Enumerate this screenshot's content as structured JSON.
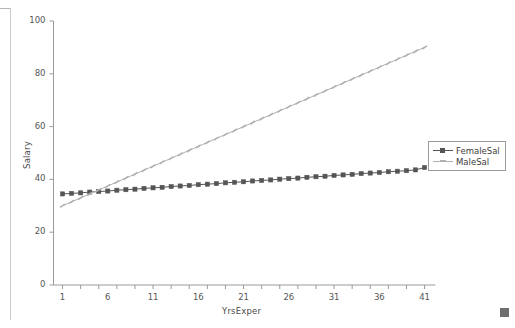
{
  "window": {
    "resize_handle": "resize-grip"
  },
  "chart_data": {
    "type": "line",
    "title": "",
    "xlabel": "YrsExper",
    "ylabel": "Salary",
    "xlim": [
      0,
      42
    ],
    "ylim": [
      0,
      100
    ],
    "xticks": [
      1,
      6,
      11,
      16,
      21,
      26,
      31,
      36,
      41
    ],
    "xtick_labels": [
      "1",
      "6",
      "11",
      "16",
      "21",
      "26",
      "31",
      "36",
      "41"
    ],
    "yticks": [
      0,
      20,
      40,
      60,
      80,
      100
    ],
    "ytick_labels": [
      "0",
      "20",
      "40",
      "60",
      "80",
      "100"
    ],
    "grid": false,
    "legend_position": "right",
    "x": [
      1,
      2,
      3,
      4,
      5,
      6,
      7,
      8,
      9,
      10,
      11,
      12,
      13,
      14,
      15,
      16,
      17,
      18,
      19,
      20,
      21,
      22,
      23,
      24,
      25,
      26,
      27,
      28,
      29,
      30,
      31,
      32,
      33,
      34,
      35,
      36,
      37,
      38,
      39,
      40,
      41
    ],
    "series": [
      {
        "name": "FemaleSal",
        "color": "#555555",
        "marker": "square",
        "values": [
          34.5,
          34.7,
          34.9,
          35.2,
          35.4,
          35.6,
          35.9,
          36.1,
          36.3,
          36.6,
          36.8,
          37.0,
          37.3,
          37.5,
          37.7,
          38.0,
          38.2,
          38.4,
          38.7,
          38.9,
          39.1,
          39.4,
          39.6,
          39.8,
          40.1,
          40.3,
          40.5,
          40.8,
          41.0,
          41.2,
          41.5,
          41.7,
          41.9,
          42.2,
          42.4,
          42.6,
          42.9,
          43.1,
          43.3,
          43.6,
          44.5
        ]
      },
      {
        "name": "MaleSal",
        "color": "#b0b0b0",
        "marker": "tick",
        "values": [
          30.0,
          31.5,
          33.0,
          34.5,
          36.0,
          37.5,
          39.0,
          40.5,
          42.0,
          43.5,
          45.0,
          46.5,
          48.0,
          49.5,
          51.0,
          52.5,
          54.0,
          55.5,
          57.0,
          58.5,
          60.0,
          61.5,
          63.0,
          64.5,
          66.0,
          67.5,
          69.0,
          70.5,
          72.0,
          73.5,
          75.0,
          76.5,
          78.0,
          79.5,
          81.0,
          82.5,
          84.0,
          85.5,
          87.0,
          88.5,
          90.0
        ]
      }
    ]
  },
  "legend": {
    "entries": [
      {
        "label": "FemaleSal"
      },
      {
        "label": "MaleSal"
      }
    ]
  }
}
